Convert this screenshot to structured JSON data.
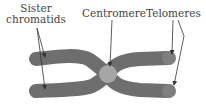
{
  "labels": {
    "sister_line1": "Sister",
    "sister_line2": "chromatids",
    "centromere": "Centromere",
    "telomeres": "Telomeres"
  },
  "colors": {
    "chromatid": "#6e6e6e",
    "telomere_tip": "#7f7f7f",
    "centromere": "#a6a6a6",
    "arrow": "#333333",
    "text": "#444444"
  }
}
